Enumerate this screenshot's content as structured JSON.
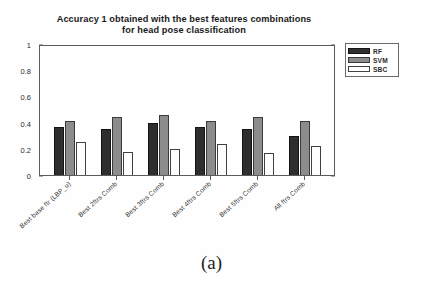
{
  "caption": "(a)",
  "chart_data": {
    "type": "bar",
    "title": "Accuracy 1 obtained with the best features combinations for head pose classification",
    "title_line1": "Accuracy 1 obtained with the best features combinations",
    "title_line2": "for head pose classification",
    "xlabel": "",
    "ylabel": "",
    "ylim": [
      0,
      1
    ],
    "yticks": [
      0,
      0.2,
      0.4,
      0.6,
      0.8,
      1
    ],
    "ytick_labels": [
      "0",
      "0.2",
      "0.4",
      "0.6",
      "0.8",
      "1"
    ],
    "grid": false,
    "legend_position": "upper right outside",
    "categories": [
      "Best base ftr (LBP_u)",
      "Best 2ftrs Comb",
      "Best 3ftrs Comb",
      "Best 4ftrs Comb",
      "Best 5ftrs Comb",
      "All ftrs Comb"
    ],
    "series": [
      {
        "name": "RF",
        "color": "#2e2e2e",
        "values": [
          0.37,
          0.355,
          0.395,
          0.37,
          0.355,
          0.3
        ]
      },
      {
        "name": "SVM",
        "color": "#8c8c8c",
        "values": [
          0.41,
          0.445,
          0.46,
          0.41,
          0.445,
          0.41
        ]
      },
      {
        "name": "SBC",
        "color": "#ffffff",
        "values": [
          0.25,
          0.175,
          0.195,
          0.24,
          0.17,
          0.22
        ]
      }
    ]
  }
}
